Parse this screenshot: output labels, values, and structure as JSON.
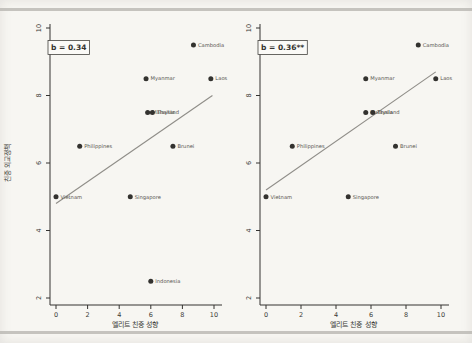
{
  "figure": {
    "background": "#f7f6f2",
    "rule_color": "#b5b3ae",
    "axis_color": "#343330",
    "marker_color": "#33322f",
    "fit_line_color": "#8f8d88",
    "label_color": "#56544f",
    "tick_label_color": "#3b3a37"
  },
  "chart_data": [
    {
      "panel": "left",
      "type": "scatter",
      "annotation": "b = 0.34",
      "xlabel": "엘리트 친중 성향",
      "ylabel": "친중 외교정책",
      "xlim": [
        0,
        10
      ],
      "ylim": [
        2,
        10
      ],
      "xticks": [
        0,
        2,
        4,
        6,
        8,
        10
      ],
      "yticks": [
        2,
        4,
        6,
        8,
        10
      ],
      "grid": false,
      "legend": "none",
      "points": [
        {
          "label": "Vietnam",
          "x": 0,
          "y": 5
        },
        {
          "label": "Philippines",
          "x": 1.5,
          "y": 6.5
        },
        {
          "label": "Singapore",
          "x": 4.7,
          "y": 5
        },
        {
          "label": "Myanmar",
          "x": 5.7,
          "y": 8.5
        },
        {
          "label": "Malaysia",
          "x": 5.8,
          "y": 7.5
        },
        {
          "label": "Thailand",
          "x": 6.1,
          "y": 7.5
        },
        {
          "label": "Indonesia",
          "x": 6,
          "y": 2.5
        },
        {
          "label": "Brunei",
          "x": 7.4,
          "y": 6.5
        },
        {
          "label": "Cambodia",
          "x": 8.7,
          "y": 9.5
        },
        {
          "label": "Laos",
          "x": 9.8,
          "y": 8.5
        }
      ],
      "fit_line": {
        "x_start": 0,
        "y_start": 4.8,
        "x_end": 9.9,
        "y_end": 8.0
      }
    },
    {
      "panel": "right",
      "type": "scatter",
      "annotation": "b = 0.36**",
      "xlabel": "엘리트 친중 성향",
      "ylabel": "",
      "xlim": [
        0,
        10
      ],
      "ylim": [
        2,
        10
      ],
      "xticks": [
        0,
        2,
        4,
        6,
        8,
        10
      ],
      "yticks": [
        2,
        4,
        6,
        8,
        10
      ],
      "grid": false,
      "legend": "none",
      "points": [
        {
          "label": "Vietnam",
          "x": 0,
          "y": 5
        },
        {
          "label": "Philippines",
          "x": 1.5,
          "y": 6.5
        },
        {
          "label": "Singapore",
          "x": 4.7,
          "y": 5
        },
        {
          "label": "Myanmar",
          "x": 5.7,
          "y": 8.5
        },
        {
          "label": "Malaysia",
          "x": 5.7,
          "y": 7.5
        },
        {
          "label": "Thailand",
          "x": 6.1,
          "y": 7.5
        },
        {
          "label": "Brunei",
          "x": 7.4,
          "y": 6.5
        },
        {
          "label": "Cambodia",
          "x": 8.7,
          "y": 9.5
        },
        {
          "label": "Laos",
          "x": 9.7,
          "y": 8.5
        }
      ],
      "fit_line": {
        "x_start": 0,
        "y_start": 5.2,
        "x_end": 9.7,
        "y_end": 8.7
      }
    }
  ]
}
